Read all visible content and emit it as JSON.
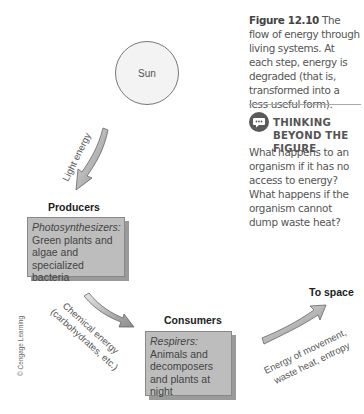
{
  "diagram": {
    "sun": {
      "label": "Sun"
    },
    "arrows": {
      "light": {
        "label": "Light energy"
      },
      "chemical": {
        "line1": "Chemical energy",
        "line2": "(carbohydrates, etc.)"
      },
      "space": {
        "line1": "Energy of movement,",
        "line2": "waste heat, entropy"
      }
    },
    "producers": {
      "title": "Producers",
      "subtitle": "Photosynthesizers:",
      "body": "Green plants and algae and specialized bacteria"
    },
    "consumers": {
      "title": "Consumers",
      "subtitle": "Respirers:",
      "body": "Animals and decomposers and plants at night"
    },
    "to_space": {
      "label": "To space"
    },
    "credit": "© Cengage Learning"
  },
  "caption": {
    "figure_label": "Figure 12.10",
    "text": "The flow of energy through living systems. At each step, energy is degraded (that is, transformed into a less useful form)."
  },
  "thinking_beyond": {
    "icon": "speech-bubble-icon",
    "title": "THINKING BEYOND THE FIGURE",
    "question": "What happens to an organism if it has no access to energy? What happens if the organism cannot dump waste heat?"
  },
  "colors": {
    "box_fill": "#bdbdbd",
    "arrow_fill": "#9e9e9e",
    "icon_bg": "#5a5a5a"
  }
}
